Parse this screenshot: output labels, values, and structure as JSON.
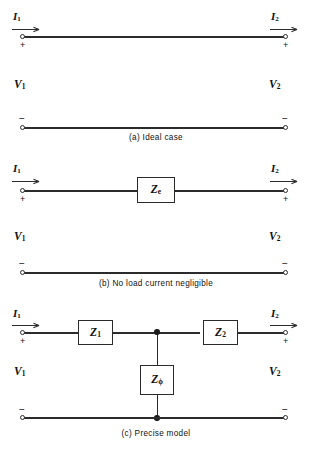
{
  "figure": {
    "line_color": "#2b2b2b",
    "background": "#ffffff"
  },
  "panels": [
    {
      "id": "a",
      "caption": "(a)   Ideal case",
      "current_in": "I",
      "current_in_sub": "1",
      "current_out": "I",
      "current_out_sub": "2",
      "voltage_in": "V",
      "voltage_in_sub": "1",
      "voltage_out": "V",
      "voltage_out_sub": "2",
      "plus_left": "+",
      "plus_right": "+",
      "minus_left": "−",
      "minus_right": "−",
      "elements": []
    },
    {
      "id": "b",
      "caption": "(b)   No load current negligible",
      "current_in": "I",
      "current_in_sub": "1",
      "current_out": "I",
      "current_out_sub": "2",
      "voltage_in": "V",
      "voltage_in_sub": "1",
      "voltage_out": "V",
      "voltage_out_sub": "2",
      "plus_left": "+",
      "plus_right": "+",
      "minus_left": "−",
      "minus_right": "−",
      "elements": [
        {
          "symbol": "Z",
          "subscript": "e",
          "kind": "series-impedance"
        }
      ]
    },
    {
      "id": "c",
      "caption": "(c)   Precise model",
      "current_in": "I",
      "current_in_sub": "1",
      "current_out": "I",
      "current_out_sub": "2",
      "voltage_in": "V",
      "voltage_in_sub": "1",
      "voltage_out": "V",
      "voltage_out_sub": "2",
      "plus_left": "+",
      "plus_right": "+",
      "minus_left": "−",
      "minus_right": "−",
      "elements": [
        {
          "symbol": "Z",
          "subscript": "1",
          "kind": "series-impedance"
        },
        {
          "symbol": "Z",
          "subscript": "2",
          "kind": "series-impedance"
        },
        {
          "symbol": "Z",
          "subscript": "ϕ",
          "kind": "shunt-impedance"
        }
      ]
    }
  ]
}
